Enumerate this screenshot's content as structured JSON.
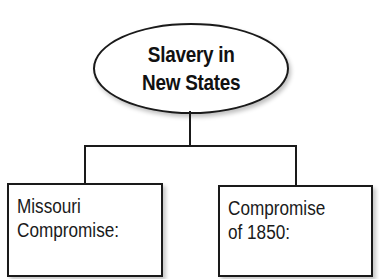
{
  "diagram": {
    "type": "tree",
    "root": {
      "shape": "ellipse",
      "lines": [
        "Slavery in",
        "New States"
      ]
    },
    "children": [
      {
        "shape": "rectangle",
        "lines": [
          "Missouri",
          "Compromise:"
        ],
        "answer": ""
      },
      {
        "shape": "rectangle",
        "lines": [
          "Compromise",
          "of 1850:"
        ],
        "answer": ""
      }
    ],
    "colors": {
      "stroke": "#1a1a1a",
      "fill": "#ffffff",
      "text": "#111111"
    }
  }
}
